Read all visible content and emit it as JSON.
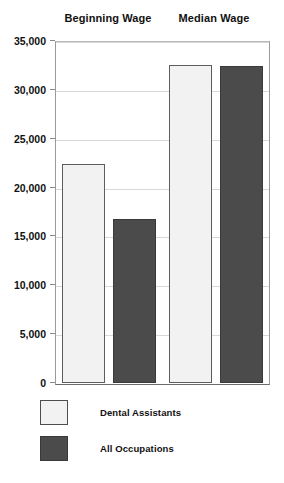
{
  "chart_data": {
    "type": "bar",
    "title": "",
    "xlabel": "",
    "ylabel": "",
    "categories": [
      "Beginning Wage",
      "Median Wage"
    ],
    "series": [
      {
        "name": "Dental Assistants",
        "color": "#f2f2f2",
        "values": [
          22400,
          32500
        ]
      },
      {
        "name": "All Occupations",
        "color": "#4b4b4b",
        "values": [
          16800,
          32400
        ]
      }
    ],
    "ylim": [
      0,
      35000
    ],
    "ytick_values": [
      0,
      5000,
      10000,
      15000,
      20000,
      25000,
      30000,
      35000
    ],
    "ytick_labels": [
      "0",
      "5,000",
      "10,000",
      "15,000",
      "20,000",
      "25,000",
      "30,000",
      "35,000"
    ],
    "grid": true,
    "legend_position": "bottom-left",
    "legend_entries": [
      {
        "label": "Dental Assistants",
        "swatch": "light-swatch"
      },
      {
        "label": "All Occupations",
        "swatch": "dark-swatch"
      }
    ]
  }
}
